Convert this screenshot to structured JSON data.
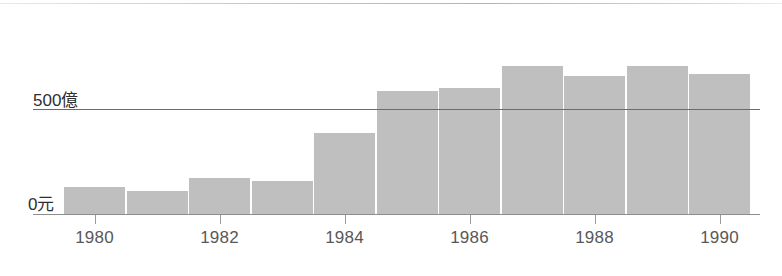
{
  "chart_data": {
    "type": "bar",
    "title": "",
    "subtitle": "",
    "xlabel": "",
    "ylabel": "",
    "categories": [
      "1980",
      "1981",
      "1982",
      "1983",
      "1984",
      "1985",
      "1986",
      "1987",
      "1988",
      "1989",
      "1990"
    ],
    "values": [
      128,
      109,
      171,
      156,
      384,
      583,
      597,
      701,
      654,
      701,
      664
    ],
    "unit": "億",
    "ylim": [
      0,
      860
    ],
    "grid": true,
    "gridlines": [
      {
        "value": 500,
        "label": "500億"
      },
      {
        "value": 0,
        "label": "0元"
      }
    ],
    "y_tick_labels": [
      "500億",
      "0元"
    ],
    "x_tick_labels": [
      "1980",
      "1982",
      "1984",
      "1986",
      "1988",
      "1990"
    ],
    "x_tick_categories": [
      "1980",
      "1982",
      "1984",
      "1986",
      "1988",
      "1990"
    ],
    "legend": [],
    "legend_position": "none",
    "annotations": [],
    "colors": {
      "bar_fill": "#bfbfbf",
      "axis_line": "#8d8d8d",
      "gridline": "#6b6b6b",
      "tick": "#9a9a9a",
      "x_label_text": "#58585a",
      "y_label_text": "#2f2f31",
      "background": "#ffffff"
    }
  },
  "axis": {
    "y_500_label": "500億",
    "y_0_label": "0元"
  },
  "x_axis": {
    "labels": [
      {
        "text": "1980"
      },
      {
        "text": "1982"
      },
      {
        "text": "1984"
      },
      {
        "text": "1986"
      },
      {
        "text": "1988"
      },
      {
        "text": "1990"
      }
    ]
  }
}
